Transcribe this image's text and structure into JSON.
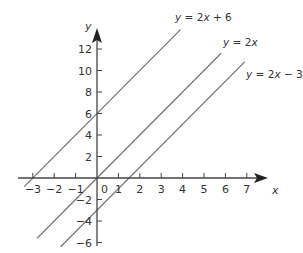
{
  "chart_data": {
    "type": "line",
    "title": "",
    "xlabel": "x",
    "ylabel": "y",
    "xlim": [
      -3.5,
      7.5
    ],
    "ylim": [
      -6.5,
      13.5
    ],
    "x_ticks": [
      -3,
      -2,
      -1,
      0,
      1,
      2,
      3,
      4,
      5,
      6,
      7
    ],
    "y_ticks": [
      -6,
      -4,
      -2,
      2,
      4,
      6,
      8,
      10,
      12
    ],
    "grid": false,
    "series": [
      {
        "name": "y = 2x + 6",
        "slope": 2,
        "intercept": 6,
        "x_range": [
          -3.4,
          3.9
        ]
      },
      {
        "name": "y = 2x",
        "slope": 2,
        "intercept": 0,
        "x_range": [
          -2.8,
          5.8
        ]
      },
      {
        "name": "y = 2x − 3",
        "slope": 2,
        "intercept": -3,
        "x_range": [
          -1.7,
          6.9
        ]
      }
    ]
  },
  "labels": {
    "x_axis": "x",
    "y_axis": "y",
    "line1": {
      "pre": "y",
      "eq": " = 2",
      "var": "x",
      "post": " + 6"
    },
    "line2": {
      "pre": "y",
      "eq": " = 2",
      "var": "x",
      "post": ""
    },
    "line3": {
      "pre": "y",
      "eq": " = 2",
      "var": "x",
      "post": " − 3"
    },
    "origin": "0"
  },
  "colors": {
    "axis": "#333333",
    "line": "#777777"
  }
}
